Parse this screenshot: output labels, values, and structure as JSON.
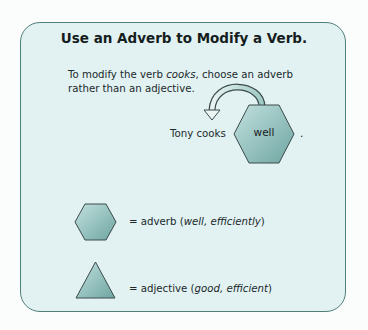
{
  "title": "Use an Adverb to Modify a Verb.",
  "intro": {
    "before": "To modify the verb ",
    "emphasis": "cooks",
    "after": ", choose an adverb rather than an adjective."
  },
  "example": {
    "sentence": "Tony cooks",
    "hexagon_word": "well",
    "period": "."
  },
  "legend": [
    {
      "shape": "hexagon",
      "prefix": "= adverb (",
      "examples": "well, efficiently",
      "suffix": ")"
    },
    {
      "shape": "triangle",
      "prefix": "= adjective (",
      "examples": "good, efficient",
      "suffix": ")"
    }
  ],
  "colors": {
    "panel_fill": "#e2f2f2",
    "panel_border": "#4f7f79",
    "shape_fill_light": "#b9dcda",
    "shape_fill_dark": "#6fa6a2",
    "shape_stroke": "#3c4a4a"
  }
}
